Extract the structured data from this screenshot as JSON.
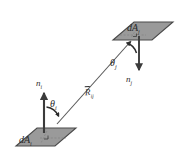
{
  "figure": {
    "background_color": "#ffffff",
    "surface_fill_color": "#9a9a9a",
    "surface_edge_color": "#4a4a4a",
    "line_color": "#5a5a5a",
    "label_color": "#2b2b2b",
    "labels": {
      "surface_j": {
        "base": "dA",
        "sub": "j"
      },
      "surface_i": {
        "base": "dA",
        "sub": "i"
      },
      "normal_i": {
        "base": "n",
        "sub": "i"
      },
      "normal_j": {
        "base": "n",
        "sub": "j"
      },
      "angle_i": {
        "base": "θ",
        "sub": "i"
      },
      "angle_j": {
        "base": "θ",
        "sub": "j"
      },
      "distance": {
        "base": "R",
        "sub": "ij"
      }
    },
    "elements": [
      {
        "name": "surface-patch-j",
        "kind": "parallelogram",
        "label": "dAj"
      },
      {
        "name": "surface-patch-i",
        "kind": "parallelogram",
        "label": "dAi"
      },
      {
        "name": "normal-vector-i",
        "kind": "arrow",
        "direction": "up",
        "label": "ni"
      },
      {
        "name": "normal-vector-j",
        "kind": "arrow",
        "direction": "down",
        "label": "nj"
      },
      {
        "name": "ray-vector-rij",
        "kind": "arrow",
        "direction": "up-right",
        "label": "Rij"
      },
      {
        "name": "angle-arc-i",
        "kind": "arc",
        "label": "thetai"
      },
      {
        "name": "angle-arc-j",
        "kind": "arc",
        "label": "thetaj"
      }
    ]
  }
}
